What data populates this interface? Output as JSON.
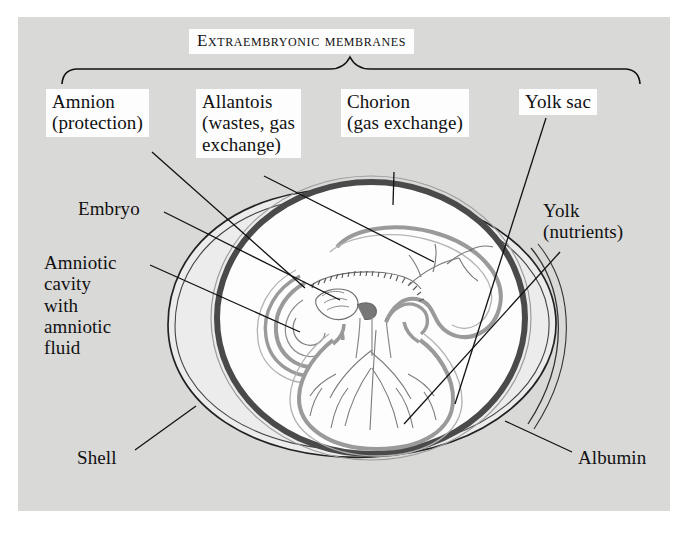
{
  "figure": {
    "title": "Extraembryonic membranes",
    "background_color": "#d9d9d7",
    "page_color": "#ffffff",
    "ink_color": "#111111",
    "chorion_ring_color": "#4a4a4a",
    "membrane_color": "#9a9a9a",
    "albumin_color": "#ececec",
    "interior_color": "#fdfdfd"
  },
  "labels": {
    "amnion": "Amnion\n(protection)",
    "allantois": "Allantois\n(wastes, gas\nexchange)",
    "chorion": "Chorion\n(gas exchange)",
    "yolk_sac": "Yolk sac",
    "embryo": "Embryo",
    "amniotic_cavity": "Amniotic\ncavity\nwith\namniotic\nfluid",
    "yolk": "Yolk\n(nutrients)",
    "shell": "Shell",
    "albumin": "Albumin"
  },
  "structures": [
    "shell",
    "albumin",
    "chorion",
    "amnion",
    "amniotic-cavity",
    "allantois",
    "yolk-sac",
    "yolk",
    "embryo"
  ]
}
